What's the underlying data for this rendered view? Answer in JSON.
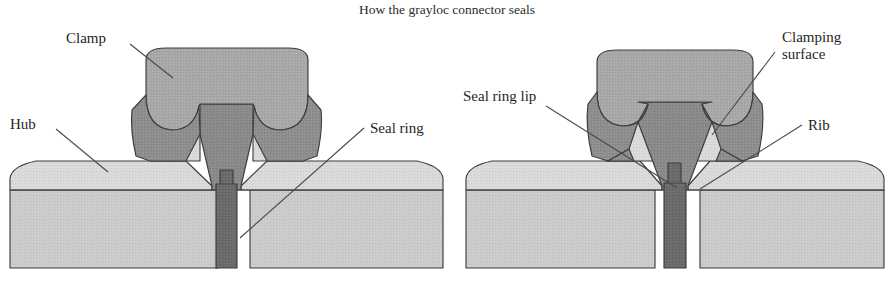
{
  "figure": {
    "title": "How the grayloc connector seals",
    "width": 894,
    "height": 281
  },
  "colors": {
    "background": "#ffffff",
    "clamp_fill": "#a8a8a8",
    "clamp_shadow_fill": "#8e8e8e",
    "hub_fill": "#d6d6d6",
    "hub_base_fill": "#cacaca",
    "seal_ring_fill": "#6b6b6b",
    "rib_fill": "#8a8a8a",
    "outline_stroke": "#3d3d3d",
    "leader_stroke": "#4a4a4a",
    "text": "#262626"
  },
  "diagrams": [
    {
      "id": "left-diagram",
      "name": "unseated-connector-cross-section",
      "labels": [
        {
          "id": "clamp",
          "text": "Clamp",
          "text_x": 66,
          "text_y": 43,
          "lines": [
            "Clamp"
          ],
          "leader": {
            "x1": 130,
            "y1": 44,
            "x2": 173,
            "y2": 78
          }
        },
        {
          "id": "hub",
          "text": "Hub",
          "text_x": 10,
          "text_y": 129,
          "lines": [
            "Hub"
          ],
          "leader": {
            "x1": 56,
            "y1": 129,
            "x2": 108,
            "y2": 172
          }
        },
        {
          "id": "seal-ring",
          "text": "Seal ring",
          "text_x": 370,
          "text_y": 133,
          "lines": [
            "Seal ring"
          ],
          "leader": {
            "x1": 364,
            "y1": 128,
            "x2": 240,
            "y2": 238
          }
        }
      ]
    },
    {
      "id": "right-diagram",
      "name": "seated-connector-cross-section",
      "labels": [
        {
          "id": "seal-ring-lip",
          "text": "Seal ring lip",
          "text_x": 463,
          "text_y": 101,
          "lines": [
            "Seal ring lip"
          ],
          "leader": {
            "x1": 546,
            "y1": 106,
            "x2": 677,
            "y2": 188
          }
        },
        {
          "id": "clamping-surface",
          "text": "Clamping surface",
          "text_x": 782,
          "text_y": 42,
          "lines": [
            "Clamping",
            "surface"
          ],
          "leader": {
            "x1": 775,
            "y1": 52,
            "x2": 712,
            "y2": 135
          }
        },
        {
          "id": "rib",
          "text": "Rib",
          "text_x": 808,
          "text_y": 130,
          "lines": [
            "Rib"
          ],
          "leader": {
            "x1": 802,
            "y1": 125,
            "x2": 700,
            "y2": 189
          }
        }
      ]
    }
  ]
}
